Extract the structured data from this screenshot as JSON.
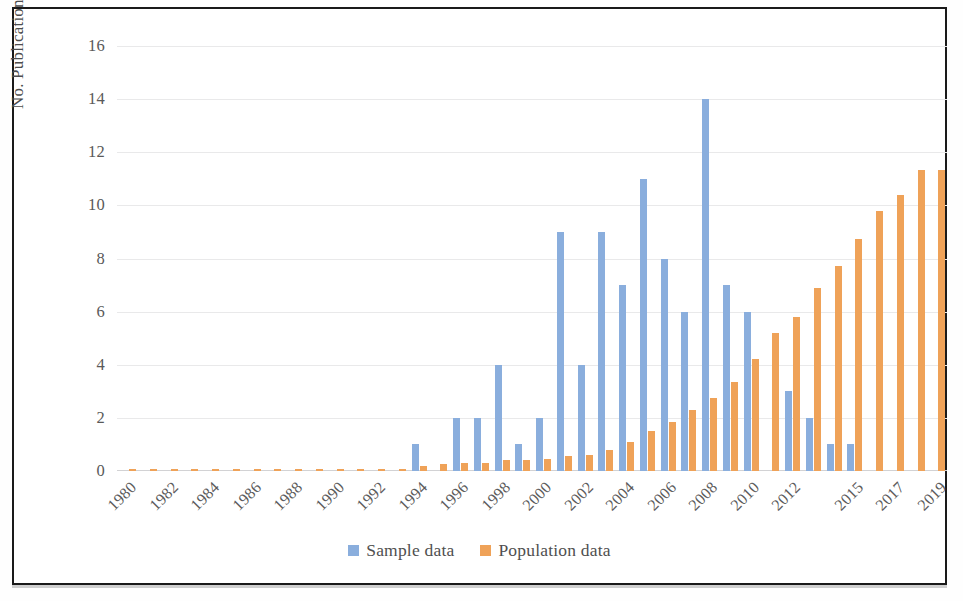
{
  "chart_data": {
    "type": "bar",
    "title": "",
    "xlabel": "",
    "ylabel": "No. Publications (%)",
    "ylim": [
      0,
      16
    ],
    "yticks": [
      "0",
      "2",
      "4",
      "6",
      "8",
      "10",
      "12",
      "14",
      "16"
    ],
    "grid": true,
    "legend_position": "bottom",
    "colors": {
      "sample": "#8aaedd",
      "population": "#efa258",
      "gridline": "#e9e9ea",
      "axis_text": "#595959",
      "frame": "#1a1a1a"
    },
    "categories": [
      "1980",
      "1981",
      "1982",
      "1983",
      "1984",
      "1985",
      "1986",
      "1987",
      "1988",
      "1989",
      "1990",
      "1991",
      "1992",
      "1993",
      "1994",
      "1995",
      "1996",
      "1997",
      "1998",
      "1999",
      "2000",
      "2001",
      "2002",
      "2003",
      "2004",
      "2005",
      "2006",
      "2007",
      "2008",
      "2009",
      "2010",
      "2011",
      "2012",
      "2013",
      "2014",
      "2015",
      "2016",
      "2017",
      "2018",
      "2019"
    ],
    "tick_labels": [
      "1980",
      "",
      "1982",
      "",
      "1984",
      "",
      "1986",
      "",
      "1988",
      "",
      "1990",
      "",
      "1992",
      "",
      "1994",
      "",
      "1996",
      "",
      "1998",
      "",
      "2000",
      "",
      "2002",
      "",
      "2004",
      "",
      "2006",
      "",
      "2008",
      "",
      "2010",
      "",
      "2012",
      "",
      "",
      "2015",
      "",
      "2017",
      "",
      "2019"
    ],
    "series": [
      {
        "name": "Sample data",
        "color": "#8aaedd",
        "values": [
          0,
          0,
          0,
          0,
          0,
          0,
          0,
          0,
          0,
          0,
          0,
          0,
          0,
          0,
          1,
          0,
          2,
          2,
          4,
          1,
          2,
          9,
          4,
          9,
          7,
          11,
          8,
          6,
          14,
          7,
          6,
          0,
          3,
          2,
          1,
          1,
          0,
          0,
          0,
          0
        ]
      },
      {
        "name": "Population data",
        "color": "#efa258",
        "values": [
          0.05,
          0.05,
          0.05,
          0.05,
          0.05,
          0.05,
          0.05,
          0.05,
          0.05,
          0.05,
          0.05,
          0.05,
          0.05,
          0.08,
          0.2,
          0.25,
          0.3,
          0.3,
          0.4,
          0.4,
          0.45,
          0.55,
          0.6,
          0.8,
          1.1,
          1.5,
          1.85,
          2.3,
          2.75,
          3.35,
          4.2,
          5.2,
          5.8,
          6.9,
          7.7,
          8.75,
          9.8,
          10.4,
          11.35,
          11.35
        ]
      }
    ]
  },
  "legend": {
    "items": [
      {
        "label": "Sample data",
        "color": "#8aaedd"
      },
      {
        "label": "Population data",
        "color": "#efa258"
      }
    ]
  },
  "axis": {
    "y_title": "No. Publications (%)"
  }
}
